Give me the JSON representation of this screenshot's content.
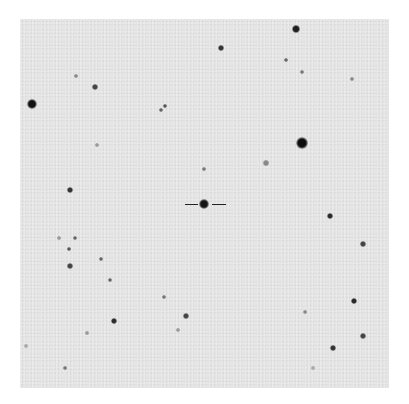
{
  "chart": {
    "frame": {
      "x": 20,
      "y": 19,
      "width": 369,
      "height": 369,
      "background": "#e4e4e4"
    },
    "target": {
      "x": 204,
      "y": 204,
      "marker": "horizontal-ticks"
    },
    "stars": [
      {
        "x": 296,
        "y": 29,
        "r": 4,
        "c": "#1e1e1e"
      },
      {
        "x": 221,
        "y": 48,
        "r": 3,
        "c": "#333"
      },
      {
        "x": 286,
        "y": 60,
        "r": 2,
        "c": "#666"
      },
      {
        "x": 302,
        "y": 72,
        "r": 2,
        "c": "#777"
      },
      {
        "x": 352,
        "y": 79,
        "r": 2,
        "c": "#888"
      },
      {
        "x": 76,
        "y": 76,
        "r": 2,
        "c": "#888"
      },
      {
        "x": 95,
        "y": 87,
        "r": 3,
        "c": "#444"
      },
      {
        "x": 32,
        "y": 104,
        "r": 5,
        "c": "#111"
      },
      {
        "x": 161,
        "y": 110,
        "r": 2,
        "c": "#666"
      },
      {
        "x": 165,
        "y": 106,
        "r": 2,
        "c": "#555"
      },
      {
        "x": 97,
        "y": 145,
        "r": 2,
        "c": "#999"
      },
      {
        "x": 302,
        "y": 143,
        "r": 6,
        "c": "#0e0e0e"
      },
      {
        "x": 266,
        "y": 163,
        "r": 3,
        "c": "#888"
      },
      {
        "x": 204,
        "y": 169,
        "r": 2,
        "c": "#777"
      },
      {
        "x": 70,
        "y": 190,
        "r": 3,
        "c": "#333"
      },
      {
        "x": 204,
        "y": 204,
        "r": 5,
        "c": "#151515"
      },
      {
        "x": 330,
        "y": 216,
        "r": 3,
        "c": "#2a2a2a"
      },
      {
        "x": 59,
        "y": 238,
        "r": 2,
        "c": "#999"
      },
      {
        "x": 75,
        "y": 238,
        "r": 2,
        "c": "#666"
      },
      {
        "x": 69,
        "y": 249,
        "r": 2,
        "c": "#555"
      },
      {
        "x": 363,
        "y": 244,
        "r": 3,
        "c": "#444"
      },
      {
        "x": 101,
        "y": 259,
        "r": 2,
        "c": "#666"
      },
      {
        "x": 70,
        "y": 266,
        "r": 3,
        "c": "#444"
      },
      {
        "x": 110,
        "y": 280,
        "r": 2,
        "c": "#666"
      },
      {
        "x": 164,
        "y": 297,
        "r": 2,
        "c": "#777"
      },
      {
        "x": 354,
        "y": 301,
        "r": 3,
        "c": "#2a2a2a"
      },
      {
        "x": 186,
        "y": 316,
        "r": 3,
        "c": "#444"
      },
      {
        "x": 305,
        "y": 312,
        "r": 2,
        "c": "#888"
      },
      {
        "x": 114,
        "y": 321,
        "r": 3,
        "c": "#2c2c2c"
      },
      {
        "x": 363,
        "y": 336,
        "r": 3,
        "c": "#444"
      },
      {
        "x": 333,
        "y": 348,
        "r": 3,
        "c": "#333"
      },
      {
        "x": 87,
        "y": 333,
        "r": 2,
        "c": "#999"
      },
      {
        "x": 178,
        "y": 330,
        "r": 2,
        "c": "#999"
      },
      {
        "x": 65,
        "y": 368,
        "r": 2,
        "c": "#777"
      },
      {
        "x": 26,
        "y": 346,
        "r": 2,
        "c": "#aaa"
      },
      {
        "x": 313,
        "y": 368,
        "r": 2,
        "c": "#aaa"
      }
    ]
  }
}
